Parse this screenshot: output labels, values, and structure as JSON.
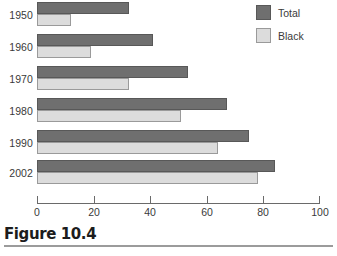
{
  "figure": {
    "caption": "Figure 10.4"
  },
  "legend": {
    "position": "top-right",
    "items": [
      {
        "label": "Total",
        "color": "#6f6f6f",
        "swatch": "total-swatch"
      },
      {
        "label": "Black",
        "color": "#dcdcdc",
        "swatch": "black-swatch"
      }
    ]
  },
  "axis": {
    "ticks": [
      "0",
      "20",
      "40",
      "60",
      "80",
      "100"
    ]
  },
  "chart_data": {
    "type": "bar",
    "orientation": "horizontal",
    "title": "Figure 10.4",
    "xlabel": "",
    "ylabel": "",
    "xlim": [
      0,
      100
    ],
    "xticks": [
      0,
      20,
      40,
      60,
      80,
      100
    ],
    "grid": false,
    "legend_position": "top-right",
    "categories": [
      "1950",
      "1960",
      "1970",
      "1980",
      "1990",
      "2002"
    ],
    "series": [
      {
        "name": "Total",
        "color": "#6f6f6f",
        "values": [
          32.5,
          41,
          53.5,
          67,
          75,
          84
        ]
      },
      {
        "name": "Black",
        "color": "#dcdcdc",
        "values": [
          12,
          19,
          32.5,
          51,
          64,
          78
        ]
      }
    ]
  }
}
